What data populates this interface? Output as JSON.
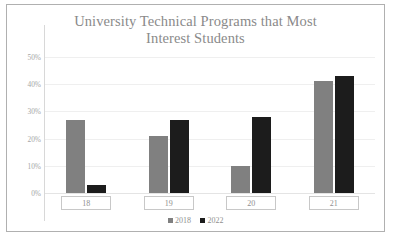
{
  "chart_data": {
    "type": "bar",
    "title": "University Technical Programs that Most Interest Students",
    "title_line1": "University Technical Programs that Most",
    "title_line2": "Interest Students",
    "xlabel": "",
    "ylabel": "",
    "categories": [
      "18",
      "19",
      "20",
      "21"
    ],
    "series": [
      {
        "name": "2018",
        "color": "#808080",
        "values": [
          27,
          21,
          10,
          41
        ]
      },
      {
        "name": "2022",
        "color": "#1c1c1c",
        "values": [
          3,
          27,
          28,
          43
        ]
      }
    ],
    "ylim": [
      0,
      50
    ],
    "ytick_values": [
      0,
      10,
      20,
      30,
      40,
      50
    ],
    "ytick_labels": [
      "0%",
      "10%",
      "20%",
      "30%",
      "40%",
      "50%"
    ],
    "grid": true,
    "legend_position": "bottom-center",
    "legend": [
      "2018",
      "2022"
    ],
    "border_color": "#b0b0b0",
    "title_color": "#8a8a8a",
    "tick_color": "#a6a6a6"
  }
}
